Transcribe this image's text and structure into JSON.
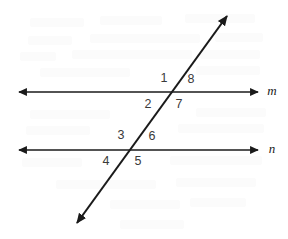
{
  "figure": {
    "background_color": "#ffffff",
    "stroke_color": "#1a1a1a",
    "label_color": "#3a3a3a",
    "width": 288,
    "height": 239
  },
  "lines": {
    "upper": {
      "name": "m",
      "label": "m",
      "label_x": 272,
      "label_y": 92,
      "y": 92,
      "x_start": 19,
      "x_end": 258,
      "arrow_start": "left",
      "arrow_end": "right"
    },
    "lower": {
      "name": "n",
      "label": "n",
      "label_x": 272,
      "label_y": 150,
      "y": 150,
      "x_start": 19,
      "x_end": 258,
      "arrow_start": "left",
      "arrow_end": "right"
    },
    "transversal": {
      "name": "transversal",
      "label": "",
      "x_top": 227,
      "y_top": 16,
      "x_bottom": 77,
      "y_bottom": 223,
      "arrow_start": "top",
      "arrow_end": "bottom"
    }
  },
  "intersections": {
    "upper": {
      "x": 175,
      "y": 92
    },
    "lower": {
      "x": 133,
      "y": 150
    }
  },
  "angle_labels": [
    {
      "id": "angle-1",
      "text": "1",
      "x": 164,
      "y": 79,
      "position": "upper-intersection-top-left"
    },
    {
      "id": "angle-8",
      "text": "8",
      "x": 191,
      "y": 80,
      "position": "upper-intersection-top-right"
    },
    {
      "id": "angle-7",
      "text": "7",
      "x": 179,
      "y": 105,
      "position": "upper-intersection-bottom-right"
    },
    {
      "id": "angle-2",
      "text": "2",
      "x": 148,
      "y": 105,
      "position": "upper-intersection-bottom-left"
    },
    {
      "id": "angle-3",
      "text": "3",
      "x": 121,
      "y": 136,
      "position": "lower-intersection-top-left"
    },
    {
      "id": "angle-6",
      "text": "6",
      "x": 152,
      "y": 137,
      "position": "lower-intersection-top-right"
    },
    {
      "id": "angle-5",
      "text": "5",
      "x": 138,
      "y": 162,
      "position": "lower-intersection-bottom-right"
    },
    {
      "id": "angle-4",
      "text": "4",
      "x": 106,
      "y": 162,
      "position": "lower-intersection-bottom-left"
    }
  ]
}
